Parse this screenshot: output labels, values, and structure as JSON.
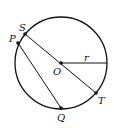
{
  "diagram": {
    "type": "geometry-circle",
    "colors": {
      "stroke": "#111111",
      "background": "#ffffff"
    },
    "circle": {
      "center_label": "O",
      "radius_label": "r"
    },
    "points": [
      {
        "label": "S"
      },
      {
        "label": "P"
      },
      {
        "label": "O"
      },
      {
        "label": "T"
      },
      {
        "label": "Q"
      }
    ],
    "segments": [
      {
        "from": "S",
        "to": "T",
        "note": "diameter through O"
      },
      {
        "from": "P",
        "to": "Q",
        "note": "chord"
      },
      {
        "from": "O",
        "to": "edge",
        "label": "r",
        "note": "radius"
      }
    ]
  }
}
